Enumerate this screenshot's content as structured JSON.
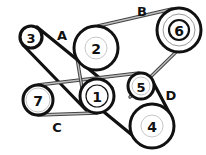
{
  "diagram": {
    "type": "serpentine-belt-routing",
    "colors": {
      "belt_dark": "#111111",
      "belt_gray": "#bdbdbd",
      "pulley_stroke": "#111111",
      "pulley_inner_ring": "#b8b8b8",
      "background": "#ffffff"
    },
    "pulleys": [
      {
        "id": "1",
        "label": "1",
        "cx": 97,
        "cy": 96,
        "r": 17
      },
      {
        "id": "2",
        "label": "2",
        "cx": 96,
        "cy": 48,
        "r": 22
      },
      {
        "id": "3",
        "label": "3",
        "cx": 31,
        "cy": 37,
        "r": 11
      },
      {
        "id": "4",
        "label": "4",
        "cx": 152,
        "cy": 126,
        "r": 22
      },
      {
        "id": "5",
        "label": "5",
        "cx": 141,
        "cy": 86,
        "r": 13
      },
      {
        "id": "6",
        "label": "6",
        "cx": 179,
        "cy": 30,
        "r": 22
      },
      {
        "id": "7",
        "label": "7",
        "cx": 38,
        "cy": 100,
        "r": 15
      }
    ],
    "belt_labels": [
      {
        "id": "A",
        "label": "A",
        "x": 62,
        "y": 35
      },
      {
        "id": "B",
        "label": "B",
        "x": 142,
        "y": 11
      },
      {
        "id": "C",
        "label": "C",
        "x": 57,
        "y": 127
      },
      {
        "id": "D",
        "label": "D",
        "x": 171,
        "y": 95
      }
    ]
  }
}
